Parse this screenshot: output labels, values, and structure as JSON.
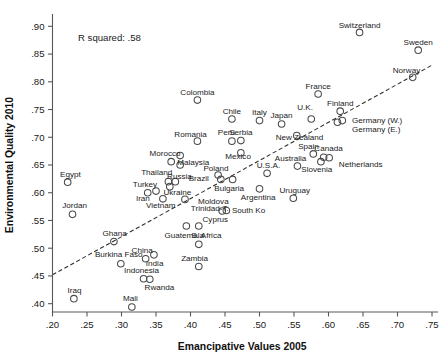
{
  "chart_data": {
    "type": "scatter",
    "title": "",
    "xlabel": "Emancipative Values 2005",
    "ylabel": "Environmental Quality 2010",
    "xlim": [
      0.2,
      0.75
    ],
    "ylim": [
      0.385,
      0.915
    ],
    "xticks": [
      ".20",
      ".25",
      ".30",
      ".35",
      ".40",
      ".45",
      ".50",
      ".55",
      ".60",
      ".65",
      ".70",
      ".75"
    ],
    "xtick_values": [
      0.2,
      0.25,
      0.3,
      0.35,
      0.4,
      0.45,
      0.5,
      0.55,
      0.6,
      0.65,
      0.7,
      0.75
    ],
    "yticks": [
      ".40",
      ".45",
      ".50",
      ".55",
      ".60",
      ".65",
      ".70",
      ".75",
      ".80",
      ".85",
      ".90"
    ],
    "ytick_values": [
      0.4,
      0.45,
      0.5,
      0.55,
      0.6,
      0.65,
      0.7,
      0.75,
      0.8,
      0.85,
      0.9
    ],
    "grid": false,
    "legend": false,
    "annotations": [
      {
        "text": "R squared: .58",
        "x": 0.237,
        "y": 0.879
      }
    ],
    "trend_line": {
      "style": "dashed",
      "x0": 0.2,
      "y0": 0.452,
      "x1": 0.75,
      "y1": 0.83
    },
    "points": [
      {
        "label": "Switzerland",
        "x": 0.645,
        "y": 0.889,
        "lx": 0.645,
        "ly": 0.902,
        "anchor": "middle"
      },
      {
        "label": "Sweden",
        "x": 0.73,
        "y": 0.857,
        "lx": 0.73,
        "ly": 0.872,
        "anchor": "middle"
      },
      {
        "label": "Norway",
        "x": 0.722,
        "y": 0.808,
        "lx": 0.713,
        "ly": 0.822,
        "anchor": "middle"
      },
      {
        "label": "France",
        "x": 0.585,
        "y": 0.778,
        "lx": 0.585,
        "ly": 0.793,
        "anchor": "middle"
      },
      {
        "label": "Colombia",
        "x": 0.41,
        "y": 0.767,
        "lx": 0.41,
        "ly": 0.782,
        "anchor": "middle"
      },
      {
        "label": "Finland",
        "x": 0.617,
        "y": 0.747,
        "lx": 0.617,
        "ly": 0.761,
        "anchor": "middle"
      },
      {
        "label": "Chile",
        "x": 0.46,
        "y": 0.733,
        "lx": 0.46,
        "ly": 0.748,
        "anchor": "middle"
      },
      {
        "label": "U.K.",
        "x": 0.575,
        "y": 0.733,
        "lx": 0.566,
        "ly": 0.754,
        "anchor": "middle"
      },
      {
        "label": "Italy",
        "x": 0.5,
        "y": 0.73,
        "lx": 0.5,
        "ly": 0.745,
        "anchor": "middle"
      },
      {
        "label": "Germany (W.)",
        "x": 0.62,
        "y": 0.73,
        "lx": 0.634,
        "ly": 0.731,
        "anchor": "start"
      },
      {
        "label": "Germany (E.)",
        "x": 0.613,
        "y": 0.727,
        "lx": 0.634,
        "ly": 0.715,
        "anchor": "start"
      },
      {
        "label": "Japan",
        "x": 0.532,
        "y": 0.724,
        "lx": 0.532,
        "ly": 0.74,
        "anchor": "middle"
      },
      {
        "label": "New Zealand",
        "x": 0.554,
        "y": 0.703,
        "lx": 0.558,
        "ly": 0.7,
        "anchor": "middle"
      },
      {
        "label": "Serbia",
        "x": 0.473,
        "y": 0.694,
        "lx": 0.473,
        "ly": 0.709,
        "anchor": "middle"
      },
      {
        "label": "Peru",
        "x": 0.46,
        "y": 0.693,
        "lx": 0.452,
        "ly": 0.71,
        "anchor": "middle"
      },
      {
        "label": "Romania",
        "x": 0.41,
        "y": 0.693,
        "lx": 0.4,
        "ly": 0.705,
        "anchor": "middle"
      },
      {
        "label": "Mexico",
        "x": 0.473,
        "y": 0.672,
        "lx": 0.469,
        "ly": 0.667,
        "anchor": "middle"
      },
      {
        "label": "Spain",
        "x": 0.578,
        "y": 0.67,
        "lx": 0.571,
        "ly": 0.684,
        "anchor": "middle"
      },
      {
        "label": "Morocco",
        "x": 0.385,
        "y": 0.667,
        "lx": 0.363,
        "ly": 0.672,
        "anchor": "middle"
      },
      {
        "label": "Canada",
        "x": 0.593,
        "y": 0.664,
        "lx": 0.6,
        "ly": 0.681,
        "anchor": "middle"
      },
      {
        "label": "Netherlands",
        "x": 0.601,
        "y": 0.663,
        "lx": 0.615,
        "ly": 0.651,
        "anchor": "start"
      },
      {
        "label": "",
        "x": 0.372,
        "y": 0.656,
        "lx": 0.372,
        "ly": 0.656,
        "anchor": "middle"
      },
      {
        "label": "Slovenia",
        "x": 0.589,
        "y": 0.656,
        "lx": 0.583,
        "ly": 0.642,
        "anchor": "middle"
      },
      {
        "label": "Malaysia",
        "x": 0.385,
        "y": 0.65,
        "lx": 0.404,
        "ly": 0.655,
        "anchor": "middle"
      },
      {
        "label": "Australia",
        "x": 0.555,
        "y": 0.648,
        "lx": 0.545,
        "ly": 0.662,
        "anchor": "middle"
      },
      {
        "label": "U.S.A.",
        "x": 0.511,
        "y": 0.635,
        "lx": 0.513,
        "ly": 0.65,
        "anchor": "middle"
      },
      {
        "label": "Poland",
        "x": 0.44,
        "y": 0.632,
        "lx": 0.437,
        "ly": 0.645,
        "anchor": "middle"
      },
      {
        "label": "Brazil",
        "x": 0.444,
        "y": 0.624,
        "lx": 0.412,
        "ly": 0.627,
        "anchor": "middle"
      },
      {
        "label": "Thailand",
        "x": 0.368,
        "y": 0.62,
        "lx": 0.351,
        "ly": 0.637,
        "anchor": "middle"
      },
      {
        "label": "Russia",
        "x": 0.378,
        "y": 0.62,
        "lx": 0.384,
        "ly": 0.63,
        "anchor": "middle"
      },
      {
        "label": "Egypt",
        "x": 0.222,
        "y": 0.619,
        "lx": 0.226,
        "ly": 0.634,
        "anchor": "middle"
      },
      {
        "label": "Bulgaria",
        "x": 0.461,
        "y": 0.624,
        "lx": 0.456,
        "ly": 0.609,
        "anchor": "middle"
      },
      {
        "label": "Ukraine",
        "x": 0.37,
        "y": 0.611,
        "lx": 0.381,
        "ly": 0.602,
        "anchor": "middle"
      },
      {
        "label": "Argentina",
        "x": 0.5,
        "y": 0.607,
        "lx": 0.498,
        "ly": 0.592,
        "anchor": "middle"
      },
      {
        "label": "Iran",
        "x": 0.35,
        "y": 0.603,
        "lx": 0.331,
        "ly": 0.591,
        "anchor": "middle"
      },
      {
        "label": "Turkey",
        "x": 0.338,
        "y": 0.6,
        "lx": 0.334,
        "ly": 0.615,
        "anchor": "middle"
      },
      {
        "label": "Uruguay",
        "x": 0.549,
        "y": 0.59,
        "lx": 0.551,
        "ly": 0.605,
        "anchor": "middle"
      },
      {
        "label": "Vietnam",
        "x": 0.36,
        "y": 0.589,
        "lx": 0.357,
        "ly": 0.578,
        "anchor": "middle"
      },
      {
        "label": "Moldova",
        "x": 0.392,
        "y": 0.588,
        "lx": 0.411,
        "ly": 0.586,
        "anchor": "start"
      },
      {
        "label": "South Ko",
        "x": 0.452,
        "y": 0.568,
        "lx": 0.46,
        "ly": 0.568,
        "anchor": "start"
      },
      {
        "label": "Trinidad-T.",
        "x": 0.446,
        "y": 0.567,
        "lx": 0.428,
        "ly": 0.572,
        "anchor": "middle"
      },
      {
        "label": "Jordan",
        "x": 0.229,
        "y": 0.561,
        "lx": 0.232,
        "ly": 0.577,
        "anchor": "middle"
      },
      {
        "label": "Guatemala",
        "x": 0.394,
        "y": 0.54,
        "lx": 0.391,
        "ly": 0.524,
        "anchor": "middle"
      },
      {
        "label": "Cyprus",
        "x": 0.412,
        "y": 0.54,
        "lx": 0.436,
        "ly": 0.552,
        "anchor": "middle"
      },
      {
        "label": "Ghana",
        "x": 0.289,
        "y": 0.512,
        "lx": 0.29,
        "ly": 0.527,
        "anchor": "middle"
      },
      {
        "label": "S. Africa",
        "x": 0.412,
        "y": 0.507,
        "lx": 0.423,
        "ly": 0.524,
        "anchor": "middle"
      },
      {
        "label": "India",
        "x": 0.347,
        "y": 0.488,
        "lx": 0.348,
        "ly": 0.474,
        "anchor": "middle"
      },
      {
        "label": "China",
        "x": 0.335,
        "y": 0.481,
        "lx": 0.33,
        "ly": 0.497,
        "anchor": "middle"
      },
      {
        "label": "Burkina Faso",
        "x": 0.299,
        "y": 0.472,
        "lx": 0.296,
        "ly": 0.489,
        "anchor": "middle"
      },
      {
        "label": "Zambia",
        "x": 0.412,
        "y": 0.467,
        "lx": 0.406,
        "ly": 0.483,
        "anchor": "middle"
      },
      {
        "label": "Indonesia",
        "x": 0.332,
        "y": 0.445,
        "lx": 0.329,
        "ly": 0.461,
        "anchor": "middle"
      },
      {
        "label": "Rwanda",
        "x": 0.341,
        "y": 0.444,
        "lx": 0.355,
        "ly": 0.43,
        "anchor": "middle"
      },
      {
        "label": "Iraq",
        "x": 0.231,
        "y": 0.409,
        "lx": 0.232,
        "ly": 0.424,
        "anchor": "middle"
      },
      {
        "label": "Mali",
        "x": 0.315,
        "y": 0.394,
        "lx": 0.313,
        "ly": 0.41,
        "anchor": "middle"
      }
    ]
  }
}
